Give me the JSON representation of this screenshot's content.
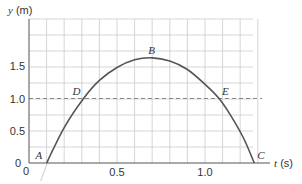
{
  "chart_data": {
    "type": "line",
    "title": "",
    "xlabel_var": "t",
    "xlabel_unit": "(s)",
    "ylabel_var": "y",
    "ylabel_unit": "(m)",
    "xlim": [
      0,
      1.35
    ],
    "ylim": [
      0,
      1.9
    ],
    "grid": true,
    "x_ticks": [
      {
        "value": 0,
        "label": "0"
      },
      {
        "value": 0.5,
        "label": "0.5"
      },
      {
        "value": 1.0,
        "label": "1.0"
      }
    ],
    "y_ticks": [
      {
        "value": 0,
        "label": "0"
      },
      {
        "value": 0.5,
        "label": "0.5"
      },
      {
        "value": 1.0,
        "label": "1.0"
      },
      {
        "value": 1.5,
        "label": "1.5"
      }
    ],
    "series": [
      {
        "name": "trajectory",
        "color": "#555555",
        "x": [
          0.1,
          0.2,
          0.31,
          0.4,
          0.5,
          0.6,
          0.7,
          0.8,
          0.9,
          1.0,
          1.08,
          1.15,
          1.22,
          1.28
        ],
        "y": [
          0.0,
          0.55,
          1.0,
          1.28,
          1.48,
          1.6,
          1.63,
          1.58,
          1.45,
          1.22,
          1.0,
          0.72,
          0.38,
          0.0
        ]
      }
    ],
    "reference_line": {
      "y": 1.0,
      "style": "dashed"
    },
    "annotations": [
      {
        "label": "A",
        "x": 0.1,
        "y": 0.0
      },
      {
        "label": "B",
        "x": 0.7,
        "y": 1.63
      },
      {
        "label": "C",
        "x": 1.28,
        "y": 0.0
      },
      {
        "label": "D",
        "x": 0.31,
        "y": 1.0
      },
      {
        "label": "E",
        "x": 1.08,
        "y": 1.0
      }
    ]
  }
}
